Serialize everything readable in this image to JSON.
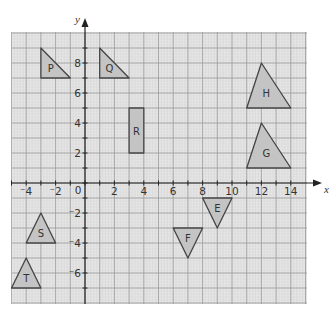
{
  "chart_data": {
    "type": "coordinate-grid",
    "title": "",
    "xlabel": "x",
    "ylabel": "y",
    "xlim": [
      -5,
      15
    ],
    "ylim": [
      -8,
      10
    ],
    "grid": true,
    "x_ticks": [
      -4,
      -2,
      0,
      2,
      4,
      6,
      8,
      10,
      12,
      14
    ],
    "y_ticks": [
      8,
      6,
      4,
      2,
      -2,
      -4,
      -6
    ],
    "x_tick_labels": [
      "-4",
      "-2",
      "0",
      "2",
      "4",
      "6",
      "8",
      "10",
      "12",
      "14"
    ],
    "y_tick_labels": [
      "8",
      "6",
      "4",
      "2",
      "-2",
      "-4",
      "-6"
    ],
    "shapes": [
      {
        "label": "P",
        "type": "triangle",
        "points": [
          [
            -3,
            9
          ],
          [
            -3,
            7
          ],
          [
            -1,
            7
          ]
        ]
      },
      {
        "label": "Q",
        "type": "triangle",
        "points": [
          [
            1,
            9
          ],
          [
            1,
            7
          ],
          [
            3,
            7
          ]
        ]
      },
      {
        "label": "R",
        "type": "rectangle",
        "points": [
          [
            3,
            5
          ],
          [
            4,
            5
          ],
          [
            4,
            2
          ],
          [
            3,
            2
          ]
        ]
      },
      {
        "label": "H",
        "type": "triangle",
        "points": [
          [
            12,
            8
          ],
          [
            11,
            5
          ],
          [
            14,
            5
          ]
        ]
      },
      {
        "label": "G",
        "type": "triangle",
        "points": [
          [
            12,
            4
          ],
          [
            11,
            1
          ],
          [
            14,
            1
          ]
        ]
      },
      {
        "label": "E",
        "type": "triangle",
        "points": [
          [
            8,
            -1
          ],
          [
            10,
            -1
          ],
          [
            9,
            -3
          ]
        ]
      },
      {
        "label": "F",
        "type": "triangle",
        "points": [
          [
            6,
            -3
          ],
          [
            8,
            -3
          ],
          [
            7,
            -5
          ]
        ]
      },
      {
        "label": "S",
        "type": "triangle",
        "points": [
          [
            -3,
            -2
          ],
          [
            -4,
            -4
          ],
          [
            -2,
            -4
          ]
        ]
      },
      {
        "label": "T",
        "type": "triangle",
        "points": [
          [
            -4,
            -5
          ],
          [
            -5,
            -7
          ],
          [
            -3,
            -7
          ]
        ]
      }
    ]
  },
  "axes": {
    "x_name": "x",
    "y_name": "y",
    "origin_label": "0"
  },
  "colors": {
    "grid_bg": "#e6e6e6",
    "grid_major": "#9a9a9a",
    "grid_minor": "#cfcfcf",
    "axis": "#222222",
    "shape_fill": "#c4c4c4",
    "shape_stroke": "#444444"
  }
}
